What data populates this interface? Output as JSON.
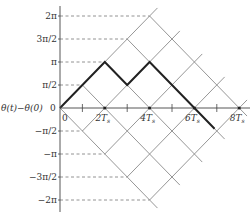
{
  "diagram": {
    "y_axis_label": "θ(t)−θ(0)",
    "origin_label": "0",
    "x_origin_label": "0",
    "y_ticks": [
      {
        "label": "2π",
        "value": 4
      },
      {
        "label": "3π/2",
        "value": 3
      },
      {
        "label": "π",
        "value": 2
      },
      {
        "label": "π/2",
        "value": 1
      },
      {
        "label": "−π/2",
        "value": -1
      },
      {
        "label": "−π",
        "value": -2
      },
      {
        "label": "−3π/2",
        "value": -3
      },
      {
        "label": "−2π",
        "value": -4
      }
    ],
    "x_ticks": [
      {
        "label": "2T",
        "sub": "s",
        "value": 2
      },
      {
        "label": "4T",
        "sub": "s",
        "value": 4
      },
      {
        "label": "6T",
        "sub": "s",
        "value": 6
      },
      {
        "label": "8T",
        "sub": "s",
        "value": 8
      }
    ],
    "x_minor_ticks": [
      1,
      3,
      5,
      7
    ],
    "x_unit": "T_s",
    "y_unit": "π/2",
    "trellis": {
      "up_line_offsets": [
        0,
        -2,
        -4,
        -6,
        -8
      ],
      "down_line_offsets": [
        0,
        2,
        4,
        6,
        8
      ],
      "t_max": 8,
      "u_max": 4
    },
    "highlighted_path": [
      [
        0,
        0
      ],
      [
        2,
        2
      ],
      [
        3,
        1
      ],
      [
        4,
        2
      ],
      [
        6,
        0
      ],
      [
        6.9,
        -0.9
      ]
    ],
    "colors": {
      "axis": "#444444",
      "trellis": "#8a8a8a",
      "path": "#222222",
      "dash": "#777777",
      "text": "#333333"
    }
  }
}
